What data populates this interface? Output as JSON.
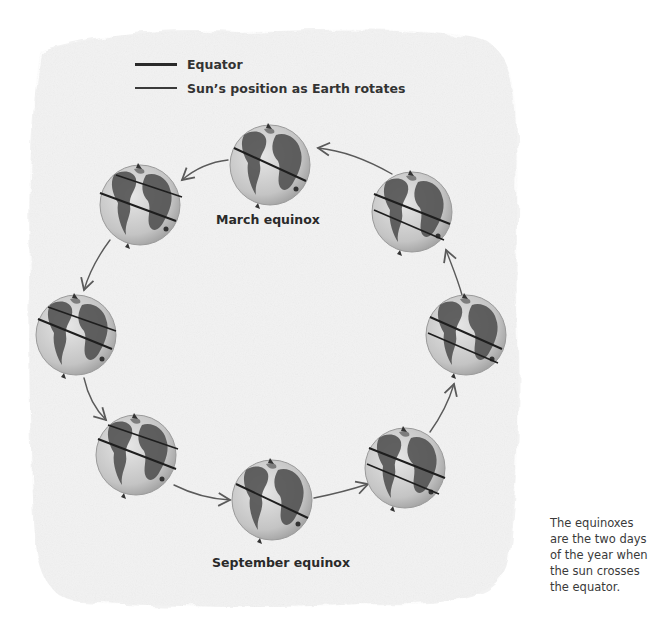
{
  "legend": {
    "items": [
      {
        "label": "Equator",
        "line_style": "thick-dark"
      },
      {
        "label": "Sun’s position as Earth rotates",
        "line_style": "thin-dark"
      }
    ]
  },
  "diagram": {
    "type": "cycle",
    "direction": "counter-clockwise",
    "globes": [
      {
        "id": "top",
        "label": "March equinox",
        "lines": [
          "sun-position-on-equator"
        ]
      },
      {
        "id": "upper-left",
        "label": "",
        "lines": [
          "equator",
          "sun-position"
        ]
      },
      {
        "id": "left",
        "label": "",
        "lines": [
          "equator",
          "sun-position"
        ]
      },
      {
        "id": "lower-left",
        "label": "",
        "lines": [
          "equator",
          "sun-position"
        ]
      },
      {
        "id": "bottom",
        "label": "September equinox",
        "lines": [
          "sun-position-on-equator"
        ]
      },
      {
        "id": "lower-right",
        "label": "",
        "lines": [
          "equator",
          "sun-position"
        ]
      },
      {
        "id": "right",
        "label": "",
        "lines": [
          "equator",
          "sun-position"
        ]
      },
      {
        "id": "upper-right",
        "label": "",
        "lines": [
          "equator",
          "sun-position"
        ]
      }
    ]
  },
  "labels": {
    "march": "March equinox",
    "september": "September equinox"
  },
  "note": "The equinoxes are the two days of the year when the sun crosses the equator.",
  "colors": {
    "paper": "#f3f3f3",
    "globe": "#c9c9c9",
    "land": "#4a4a4a",
    "line": "#1e1e1e",
    "arrow": "#5a5a5a"
  }
}
